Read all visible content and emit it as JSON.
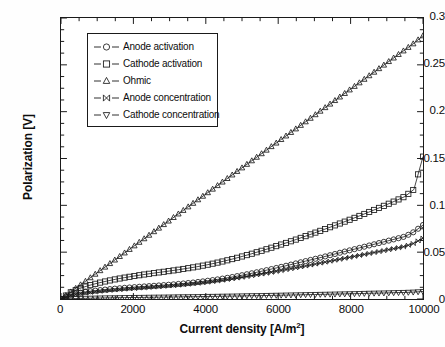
{
  "chart_data": {
    "type": "line",
    "title": "",
    "xlabel": "Current density [A/m2]",
    "xlabel_base": "Current density [A/m",
    "xlabel_sup": "2",
    "xlabel_tail": "]",
    "ylabel": "Polarization [V]",
    "xlim": [
      0,
      10000
    ],
    "ylim": [
      0,
      0.3
    ],
    "xticks": [
      0,
      2000,
      4000,
      6000,
      8000,
      10000
    ],
    "xtick_labels": [
      "0",
      "2000",
      "4000",
      "6000",
      "8000",
      "10000"
    ],
    "yticks": [
      0,
      0.05,
      0.1,
      0.15,
      0.2,
      0.25,
      0.3
    ],
    "ytick_labels": [
      "0",
      "0.05",
      "0.1",
      "0.15",
      "0.2",
      "0.25",
      "0.3"
    ],
    "x_minor_tick_interval": 500,
    "y_minor_tick_interval": 0.0125,
    "grid": false,
    "legend_position": "upper left",
    "x": [
      0,
      250,
      500,
      750,
      1000,
      1250,
      1500,
      1750,
      2000,
      2250,
      2500,
      2750,
      3000,
      3250,
      3500,
      3750,
      4000,
      4250,
      4500,
      4750,
      5000,
      5250,
      5500,
      5750,
      6000,
      6250,
      6500,
      6750,
      7000,
      7250,
      7500,
      7750,
      8000,
      8250,
      8500,
      8750,
      9000,
      9250,
      9500,
      9750,
      10000
    ],
    "series": [
      {
        "name": "Anode activation",
        "marker": "circle",
        "color": "#1a1a1a",
        "values": [
          0,
          0.0043,
          0.0065,
          0.008,
          0.0092,
          0.0102,
          0.0111,
          0.0119,
          0.0126,
          0.0133,
          0.0139,
          0.0146,
          0.0153,
          0.0161,
          0.017,
          0.018,
          0.0192,
          0.0205,
          0.022,
          0.0236,
          0.0254,
          0.0273,
          0.0293,
          0.0314,
          0.0336,
          0.0358,
          0.0381,
          0.0404,
          0.0427,
          0.045,
          0.0474,
          0.0498,
          0.0522,
          0.0546,
          0.057,
          0.0594,
          0.0618,
          0.0642,
          0.0667,
          0.0716,
          0.079
        ]
      },
      {
        "name": "Cathode activation",
        "marker": "square",
        "color": "#1a1a1a",
        "values": [
          0,
          0.0068,
          0.011,
          0.0142,
          0.0168,
          0.019,
          0.021,
          0.0228,
          0.0244,
          0.0259,
          0.0273,
          0.0286,
          0.0299,
          0.0313,
          0.0328,
          0.0344,
          0.0362,
          0.0382,
          0.0404,
          0.0428,
          0.0454,
          0.0481,
          0.051,
          0.054,
          0.0571,
          0.0603,
          0.0636,
          0.067,
          0.0705,
          0.074,
          0.0776,
          0.0813,
          0.085,
          0.0888,
          0.0927,
          0.0967,
          0.1008,
          0.105,
          0.1094,
          0.117,
          0.152
        ]
      },
      {
        "name": "Ohmic",
        "marker": "triangle-up",
        "color": "#1a1a1a",
        "values": [
          0,
          0.007,
          0.014,
          0.021,
          0.028,
          0.035,
          0.042,
          0.049,
          0.056,
          0.063,
          0.07,
          0.077,
          0.084,
          0.091,
          0.098,
          0.105,
          0.112,
          0.119,
          0.126,
          0.133,
          0.14,
          0.147,
          0.154,
          0.161,
          0.168,
          0.175,
          0.182,
          0.189,
          0.196,
          0.203,
          0.21,
          0.217,
          0.224,
          0.231,
          0.238,
          0.245,
          0.252,
          0.259,
          0.266,
          0.273,
          0.281
        ]
      },
      {
        "name": "Anode concentration",
        "marker": "bowtie",
        "color": "#1a1a1a",
        "values": [
          0,
          0.0035,
          0.0054,
          0.0068,
          0.0079,
          0.0089,
          0.0097,
          0.0105,
          0.0112,
          0.0119,
          0.0126,
          0.0133,
          0.014,
          0.0148,
          0.0157,
          0.0167,
          0.0178,
          0.019,
          0.0203,
          0.0217,
          0.0232,
          0.0248,
          0.0264,
          0.0281,
          0.0298,
          0.0316,
          0.0334,
          0.0352,
          0.0371,
          0.039,
          0.0409,
          0.0428,
          0.0447,
          0.0466,
          0.0485,
          0.0504,
          0.0523,
          0.0542,
          0.0561,
          0.0595,
          0.065
        ]
      },
      {
        "name": "Cathode concentration",
        "marker": "triangle-down",
        "color": "#1a1a1a",
        "values": [
          0,
          0.0003,
          0.0006,
          0.0008,
          0.001,
          0.0012,
          0.0013,
          0.0015,
          0.0016,
          0.0017,
          0.0019,
          0.002,
          0.0021,
          0.0023,
          0.0024,
          0.0025,
          0.0027,
          0.0028,
          0.003,
          0.0031,
          0.0033,
          0.0035,
          0.0036,
          0.0038,
          0.004,
          0.0042,
          0.0044,
          0.0046,
          0.0048,
          0.005,
          0.0052,
          0.0054,
          0.0056,
          0.0058,
          0.0061,
          0.0063,
          0.0065,
          0.0068,
          0.007,
          0.0074,
          0.008
        ]
      }
    ]
  }
}
